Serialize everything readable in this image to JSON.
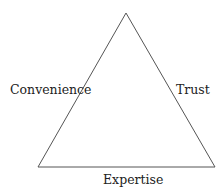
{
  "diagram": {
    "type": "triangle",
    "stroke_color": "#555555",
    "vertices": {
      "apex": [
        126,
        13
      ],
      "bottom_left": [
        38,
        167
      ],
      "bottom_right": [
        215,
        167
      ]
    },
    "labels": {
      "left_side": "Convenience",
      "right_side": "Trust",
      "bottom_side": "Expertise"
    }
  }
}
